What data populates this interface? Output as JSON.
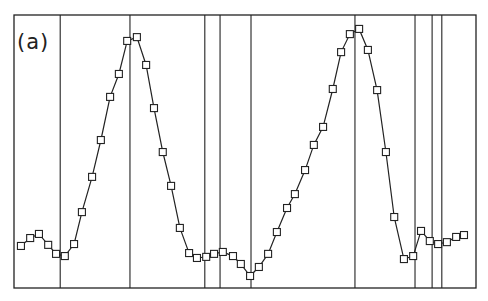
{
  "chart_data": {
    "type": "line",
    "title": "",
    "panel_label": "(a)",
    "xlabel": "",
    "ylabel": "",
    "grid": false,
    "legend": null,
    "markers": "open-square",
    "axes_units": "normalized (no tick labels shown)",
    "xlim": [
      0,
      1
    ],
    "ylim": [
      0,
      1
    ],
    "frame_px": {
      "left": 14,
      "top": 15,
      "right": 476,
      "bottom": 288
    },
    "vertical_lines_x": [
      0.1,
      0.251,
      0.413,
      0.446,
      0.513,
      0.738,
      0.868,
      0.905,
      0.926
    ],
    "series": [
      {
        "name": "signal",
        "x": [
          0.015,
          0.035,
          0.054,
          0.074,
          0.091,
          0.11,
          0.13,
          0.147,
          0.169,
          0.188,
          0.208,
          0.227,
          0.245,
          0.266,
          0.286,
          0.303,
          0.322,
          0.34,
          0.359,
          0.379,
          0.396,
          0.416,
          0.433,
          0.452,
          0.474,
          0.491,
          0.511,
          0.53,
          0.55,
          0.569,
          0.591,
          0.608,
          0.63,
          0.649,
          0.669,
          0.69,
          0.708,
          0.727,
          0.747,
          0.766,
          0.786,
          0.805,
          0.823,
          0.844,
          0.864,
          0.881,
          0.9,
          0.918,
          0.937,
          0.957,
          0.974
        ],
        "y": [
          0.154,
          0.183,
          0.198,
          0.158,
          0.125,
          0.117,
          0.161,
          0.278,
          0.407,
          0.542,
          0.7,
          0.784,
          0.905,
          0.919,
          0.817,
          0.659,
          0.498,
          0.374,
          0.22,
          0.128,
          0.11,
          0.114,
          0.125,
          0.132,
          0.117,
          0.088,
          0.044,
          0.077,
          0.125,
          0.205,
          0.293,
          0.344,
          0.432,
          0.524,
          0.59,
          0.729,
          0.864,
          0.93,
          0.949,
          0.872,
          0.725,
          0.498,
          0.26,
          0.106,
          0.117,
          0.209,
          0.172,
          0.161,
          0.168,
          0.187,
          0.194
        ]
      }
    ]
  }
}
